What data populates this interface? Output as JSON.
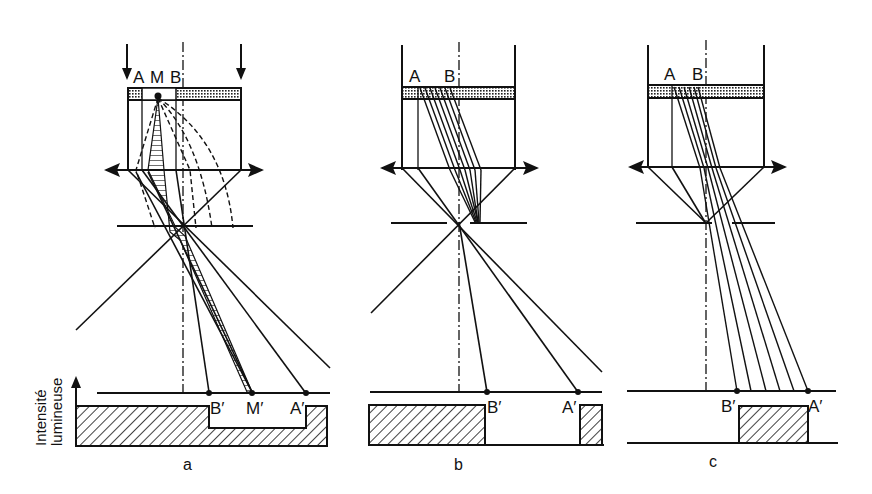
{
  "figure": {
    "ink_color": "#111111",
    "background": "#ffffff",
    "y_axis_label_line1": "Intensité",
    "y_axis_label_line2": "lumineuse",
    "panels": [
      {
        "id": "a",
        "caption": "a",
        "object_labels": [
          "A",
          "M",
          "B"
        ],
        "image_labels": [
          "B′",
          "M′",
          "A′"
        ],
        "intensity_profile": "bright background with reduced (partial) intensity between B′ and A′"
      },
      {
        "id": "b",
        "caption": "b",
        "object_labels": [
          "A",
          "B"
        ],
        "image_labels": [
          "B′",
          "A′"
        ],
        "intensity_profile": "bright background, dark (zero) between B′ and A′"
      },
      {
        "id": "c",
        "caption": "c",
        "object_labels": [
          "A",
          "B"
        ],
        "image_labels": [
          "B′",
          "A′"
        ],
        "intensity_profile": "dark background, bright only between B′ and A′"
      }
    ]
  }
}
